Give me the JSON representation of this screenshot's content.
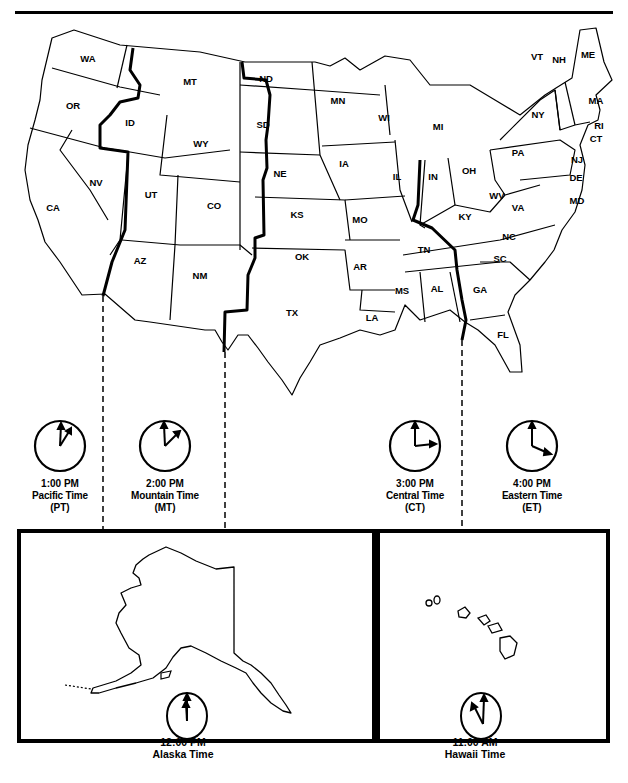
{
  "map": {
    "title": "U.S. Time Zones",
    "states": [
      {
        "abbr": "WA",
        "x": 88,
        "y": 62
      },
      {
        "abbr": "OR",
        "x": 73,
        "y": 109
      },
      {
        "abbr": "CA",
        "x": 53,
        "y": 211
      },
      {
        "abbr": "NV",
        "x": 96,
        "y": 186
      },
      {
        "abbr": "ID",
        "x": 130,
        "y": 126
      },
      {
        "abbr": "MT",
        "x": 190,
        "y": 85
      },
      {
        "abbr": "WY",
        "x": 201,
        "y": 147
      },
      {
        "abbr": "UT",
        "x": 151,
        "y": 198
      },
      {
        "abbr": "CO",
        "x": 214,
        "y": 209
      },
      {
        "abbr": "AZ",
        "x": 140,
        "y": 264
      },
      {
        "abbr": "NM",
        "x": 200,
        "y": 279
      },
      {
        "abbr": "ND",
        "x": 266,
        "y": 82
      },
      {
        "abbr": "SD",
        "x": 263,
        "y": 128
      },
      {
        "abbr": "NE",
        "x": 280,
        "y": 177
      },
      {
        "abbr": "KS",
        "x": 297,
        "y": 218
      },
      {
        "abbr": "OK",
        "x": 302,
        "y": 260
      },
      {
        "abbr": "TX",
        "x": 292,
        "y": 316
      },
      {
        "abbr": "MN",
        "x": 338,
        "y": 104
      },
      {
        "abbr": "IA",
        "x": 344,
        "y": 167
      },
      {
        "abbr": "MO",
        "x": 360,
        "y": 223
      },
      {
        "abbr": "AR",
        "x": 360,
        "y": 270
      },
      {
        "abbr": "LA",
        "x": 372,
        "y": 321
      },
      {
        "abbr": "WI",
        "x": 384,
        "y": 121
      },
      {
        "abbr": "IL",
        "x": 397,
        "y": 180
      },
      {
        "abbr": "MI",
        "x": 438,
        "y": 130
      },
      {
        "abbr": "IN",
        "x": 433,
        "y": 180
      },
      {
        "abbr": "OH",
        "x": 469,
        "y": 174
      },
      {
        "abbr": "KY",
        "x": 465,
        "y": 220
      },
      {
        "abbr": "TN",
        "x": 424,
        "y": 253
      },
      {
        "abbr": "MS",
        "x": 402,
        "y": 294
      },
      {
        "abbr": "AL",
        "x": 437,
        "y": 292
      },
      {
        "abbr": "GA",
        "x": 480,
        "y": 293
      },
      {
        "abbr": "FL",
        "x": 503,
        "y": 338
      },
      {
        "abbr": "SC",
        "x": 500,
        "y": 262
      },
      {
        "abbr": "NC",
        "x": 509,
        "y": 240
      },
      {
        "abbr": "VA",
        "x": 518,
        "y": 211
      },
      {
        "abbr": "WV",
        "x": 497,
        "y": 199
      },
      {
        "abbr": "PA",
        "x": 518,
        "y": 156
      },
      {
        "abbr": "NY",
        "x": 538,
        "y": 118
      },
      {
        "abbr": "VT",
        "x": 537,
        "y": 60
      },
      {
        "abbr": "NH",
        "x": 559,
        "y": 63
      },
      {
        "abbr": "ME",
        "x": 588,
        "y": 58
      },
      {
        "abbr": "MA",
        "x": 596,
        "y": 104
      },
      {
        "abbr": "RI",
        "x": 599,
        "y": 129
      },
      {
        "abbr": "CT",
        "x": 596,
        "y": 142
      },
      {
        "abbr": "NJ",
        "x": 577,
        "y": 163
      },
      {
        "abbr": "DE",
        "x": 576,
        "y": 181
      },
      {
        "abbr": "MD",
        "x": 577,
        "y": 204
      }
    ]
  },
  "clocks": [
    {
      "id": "pacific",
      "time": "1:00 PM",
      "zone": "Pacific Time",
      "abbr": "(PT)",
      "hour_deg": 30,
      "minute_deg": 5
    },
    {
      "id": "mountain",
      "time": "2:00 PM",
      "zone": "Mountain Time",
      "abbr": "(MT)",
      "hour_deg": 60,
      "minute_deg": 0
    },
    {
      "id": "central",
      "time": "3:00 PM",
      "zone": "Central Time",
      "abbr": "(CT)",
      "hour_deg": 90,
      "minute_deg": 0
    },
    {
      "id": "eastern",
      "time": "4:00 PM",
      "zone": "Eastern Time",
      "abbr": "(ET)",
      "hour_deg": 115,
      "minute_deg": 0
    }
  ],
  "insets": {
    "alaska": {
      "time": "12:00 PM",
      "zone": "Alaska Time"
    },
    "hawaii": {
      "time": "11:00 AM",
      "zone": "Hawaii Time"
    }
  }
}
